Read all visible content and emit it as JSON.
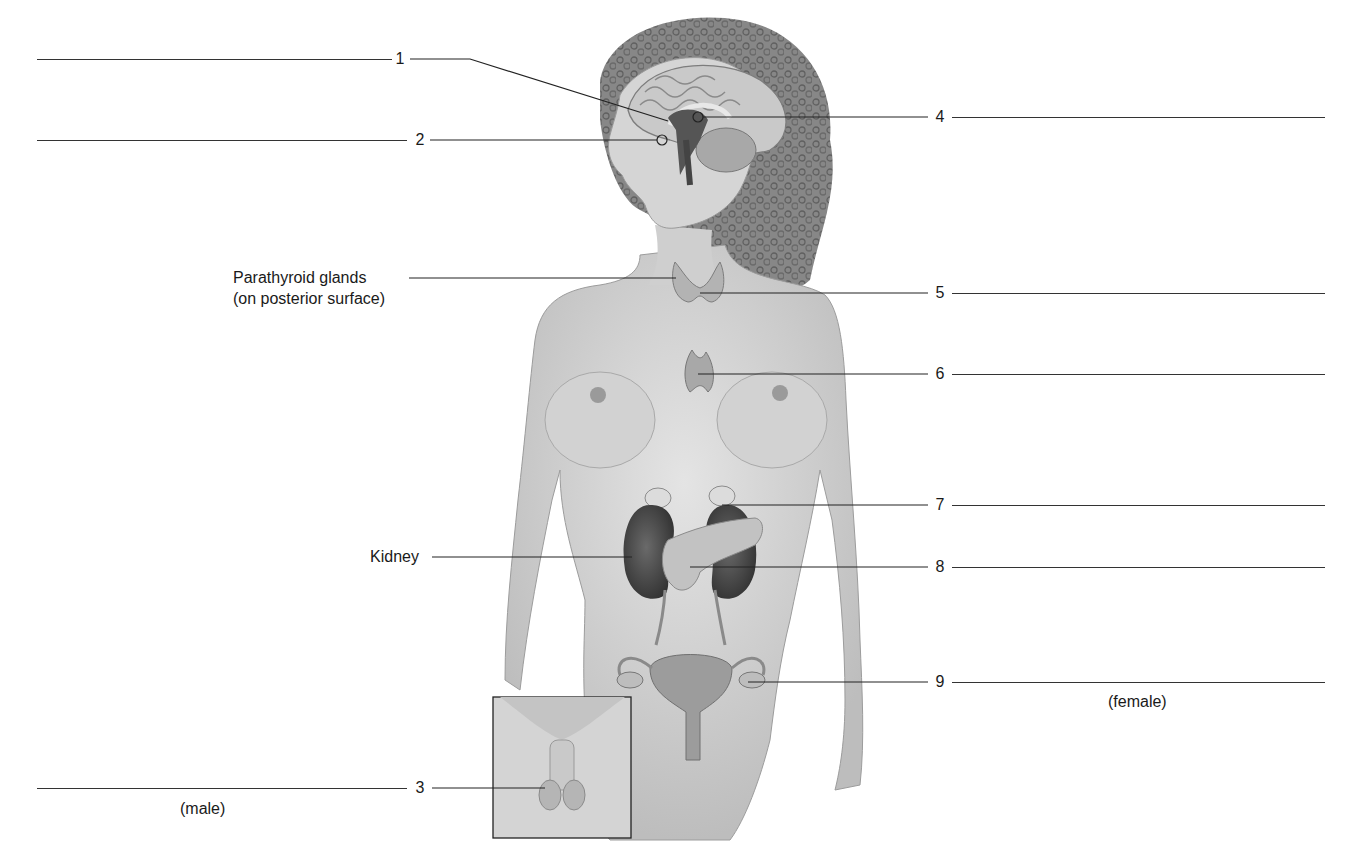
{
  "diagram": {
    "colors": {
      "background": "#ffffff",
      "line": "#333333",
      "skin": "#d6d6d6",
      "skin_shade": "#b8b8b8",
      "hair": "#6e6e6e",
      "brain": "#c8c8c8",
      "gland": "#b0b0b0",
      "kidney": "#4a4a4a"
    },
    "numbered_labels": [
      {
        "id": "1",
        "text": "1",
        "side": "left"
      },
      {
        "id": "2",
        "text": "2",
        "side": "left"
      },
      {
        "id": "3",
        "text": "3",
        "side": "left",
        "caption": "(male)"
      },
      {
        "id": "4",
        "text": "4",
        "side": "right"
      },
      {
        "id": "5",
        "text": "5",
        "side": "right"
      },
      {
        "id": "6",
        "text": "6",
        "side": "right"
      },
      {
        "id": "7",
        "text": "7",
        "side": "right"
      },
      {
        "id": "8",
        "text": "8",
        "side": "right"
      },
      {
        "id": "9",
        "text": "9",
        "side": "right",
        "caption": "(female)"
      }
    ],
    "given_labels": {
      "parathyroid_line1": "Parathyroid glands",
      "parathyroid_line2": "(on posterior surface)",
      "kidney": "Kidney"
    },
    "captions": {
      "male": "(male)",
      "female": "(female)"
    }
  }
}
